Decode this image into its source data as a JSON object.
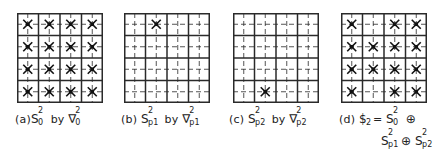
{
  "figure": {
    "grid": {
      "rows": 4,
      "cols": 4,
      "line_color": "#2a2a2a",
      "marker_color": "#111111"
    },
    "panels": [
      {
        "id": "a",
        "prefix": "(a)",
        "S": "S",
        "S_sup": "2",
        "S_sub": "0",
        "by": "by",
        "N": "∇",
        "N_sup": "2",
        "N_sub": "0",
        "marks": [
          [
            1,
            1
          ],
          [
            1,
            2
          ],
          [
            1,
            3
          ],
          [
            1,
            4
          ],
          [
            2,
            1
          ],
          [
            2,
            2
          ],
          [
            2,
            3
          ],
          [
            2,
            4
          ],
          [
            3,
            1
          ],
          [
            3,
            2
          ],
          [
            3,
            3
          ],
          [
            3,
            4
          ],
          [
            4,
            1
          ],
          [
            4,
            2
          ],
          [
            4,
            3
          ],
          [
            4,
            4
          ]
        ]
      },
      {
        "id": "b",
        "prefix": "(b)",
        "S": "S",
        "S_sup": "2",
        "S_sub": "p1",
        "by": "by",
        "N": "∇",
        "N_sup": "2",
        "N_sub": "p1",
        "marks": [
          [
            1,
            2
          ]
        ]
      },
      {
        "id": "c",
        "prefix": "(c)",
        "S": "S",
        "S_sup": "2",
        "S_sub": "p2",
        "by": "by",
        "N": "∇",
        "N_sup": "2",
        "N_sub": "p2",
        "marks": [
          [
            4,
            2
          ]
        ]
      },
      {
        "id": "d",
        "prefix": "(d)",
        "lhs": "$",
        "lhs_sub": "2",
        "eq": "=",
        "t1": "S",
        "t1_sup": "2",
        "t1_sub": "0",
        "op": "⊕",
        "t2": "S",
        "t2_sup": "2",
        "t2_sub": "p1",
        "t3": "S",
        "t3_sup": "2",
        "t3_sub": "p2",
        "marks": [
          [
            1,
            1
          ],
          [
            1,
            3
          ],
          [
            1,
            4
          ],
          [
            2,
            1
          ],
          [
            2,
            2
          ],
          [
            2,
            3
          ],
          [
            2,
            4
          ],
          [
            3,
            1
          ],
          [
            3,
            2
          ],
          [
            3,
            3
          ],
          [
            3,
            4
          ],
          [
            4,
            1
          ],
          [
            4,
            3
          ],
          [
            4,
            4
          ]
        ]
      }
    ]
  }
}
